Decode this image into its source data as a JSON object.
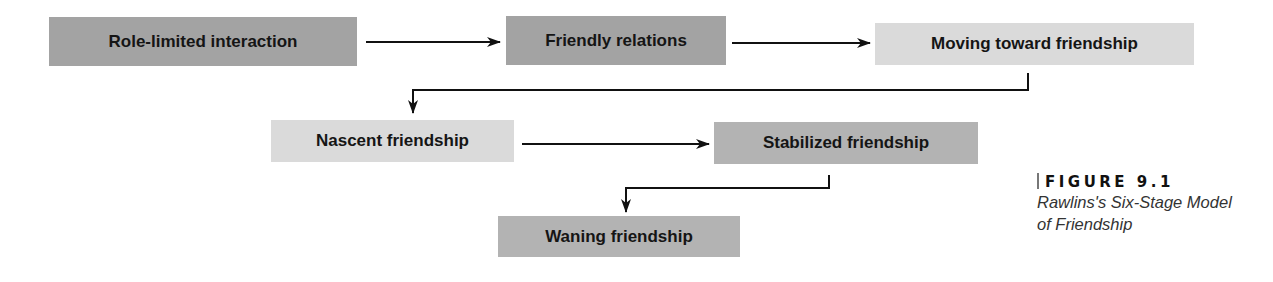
{
  "diagram": {
    "title": "Rawlins's Six-Stage Model of Friendship",
    "stages": [
      {
        "label": "Role-limited interaction",
        "shade": "dark"
      },
      {
        "label": "Friendly relations",
        "shade": "dark"
      },
      {
        "label": "Moving toward friendship",
        "shade": "light"
      },
      {
        "label": "Nascent friendship",
        "shade": "light"
      },
      {
        "label": "Stabilized friendship",
        "shade": "medium"
      },
      {
        "label": "Waning friendship",
        "shade": "medium"
      }
    ],
    "edges": [
      {
        "from": "Role-limited interaction",
        "to": "Friendly relations"
      },
      {
        "from": "Friendly relations",
        "to": "Moving toward friendship"
      },
      {
        "from": "Moving toward friendship",
        "to": "Nascent friendship"
      },
      {
        "from": "Nascent friendship",
        "to": "Stabilized friendship"
      },
      {
        "from": "Stabilized friendship",
        "to": "Waning friendship"
      }
    ],
    "colors": {
      "dark": "#a3a3a3",
      "light": "#dadada",
      "medium": "#b3b3b3",
      "arrow": "#111111"
    }
  },
  "caption": {
    "figure_label": "FIGURE 9.1",
    "title_line1": "Rawlins's Six-Stage Model",
    "title_line2": "of Friendship"
  }
}
